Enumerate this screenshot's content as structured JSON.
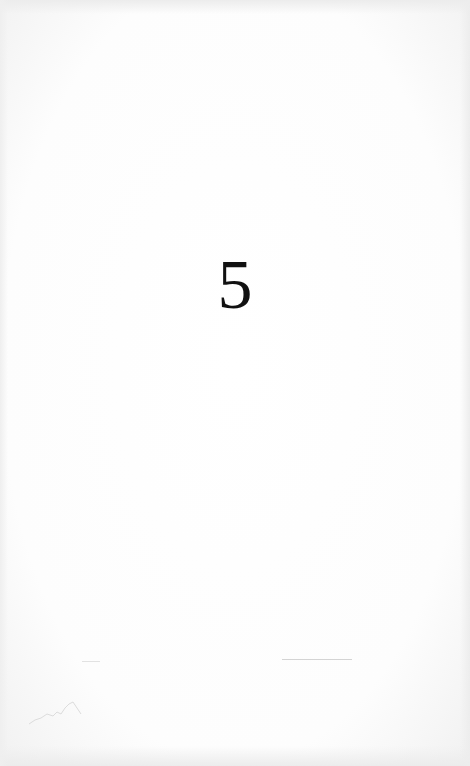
{
  "page": {
    "type": "chapter-opening",
    "chapter_number": "5"
  },
  "colors": {
    "paper": "#fdfdfd",
    "ink": "#111111"
  }
}
